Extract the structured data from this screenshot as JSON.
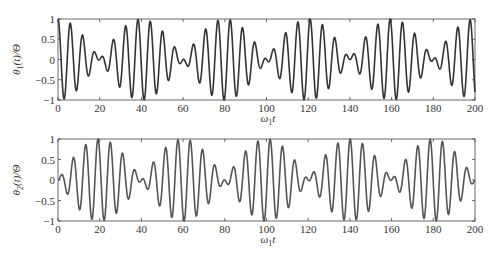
{
  "chart_data": [
    {
      "type": "line",
      "title": "",
      "xlabel": "ω1t",
      "ylabel": "θ1(t)/Θ",
      "xlim": [
        0,
        200
      ],
      "ylim": [
        -1,
        1
      ],
      "xticks": [
        0,
        20,
        40,
        60,
        80,
        100,
        120,
        140,
        160,
        180,
        200
      ],
      "yticks": [
        -1,
        -0.5,
        0,
        0.5,
        1
      ],
      "ytick_labels": [
        "−1",
        "−0.5",
        "0",
        "0.5",
        "1"
      ],
      "grid": false,
      "series": [
        {
          "name": "θ1(t)/Θ",
          "formula": "cos(π t/40)·cos(1.065 t)",
          "color": "#333333",
          "description": "beating signal, envelope maxima at t=0,40,80,120,160,200; nodes near t=20,60,100,140,180"
        }
      ]
    },
    {
      "type": "line",
      "title": "",
      "xlabel": "ω1t",
      "ylabel": "θ2(t)/Θ",
      "xlim": [
        0,
        200
      ],
      "ylim": [
        -1,
        1
      ],
      "xticks": [
        0,
        20,
        40,
        60,
        80,
        100,
        120,
        140,
        160,
        180,
        200
      ],
      "yticks": [
        -1,
        -0.5,
        0,
        0.5,
        1
      ],
      "ytick_labels": [
        "−1",
        "−0.5",
        "0",
        "0.5",
        "1"
      ],
      "grid": false,
      "series": [
        {
          "name": "θ2(t)/Θ",
          "formula": "sin(π t/40)·sin(1.065 t)",
          "color": "#555555",
          "description": "beating signal, envelope maxima at t=20,60,100,140,180; nodes near t=0,40,80,120,160,200"
        }
      ]
    }
  ],
  "plots": {
    "top": {
      "ylabel_main": "θ",
      "ylabel_sub": "1",
      "ylabel_rest": "(t)/Θ",
      "xlabel_main": "ω",
      "xlabel_sub": "1",
      "xlabel_rest": "t"
    },
    "bottom": {
      "ylabel_main": "θ",
      "ylabel_sub": "2",
      "ylabel_rest": "(t)/Θ",
      "xlabel_main": "ω",
      "xlabel_sub": "1",
      "xlabel_rest": "t"
    }
  }
}
